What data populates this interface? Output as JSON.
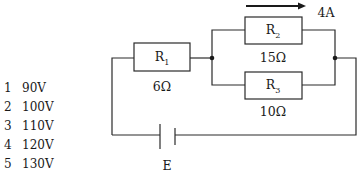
{
  "diagram": {
    "type": "circuit",
    "colors": {
      "stroke": "#2a2a2a",
      "background": "#ffffff"
    },
    "resistors": [
      {
        "id": "R1",
        "name": "R",
        "sub": "1",
        "value": "6Ω"
      },
      {
        "id": "R2",
        "name": "R",
        "sub": "2",
        "value": "15Ω"
      },
      {
        "id": "R3",
        "name": "R",
        "sub": "3",
        "value": "10Ω"
      }
    ],
    "current": {
      "label": "4A",
      "through": "R2",
      "direction": "right"
    },
    "source": {
      "label": "E"
    }
  },
  "options": [
    {
      "num": "1",
      "text": "90V"
    },
    {
      "num": "2",
      "text": "100V"
    },
    {
      "num": "3",
      "text": "110V"
    },
    {
      "num": "4",
      "text": "120V"
    },
    {
      "num": "5",
      "text": "130V"
    }
  ]
}
